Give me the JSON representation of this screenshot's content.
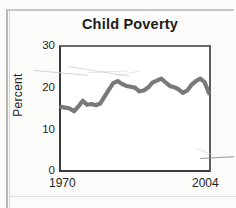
{
  "figure": {
    "background_color": "#fbfbf9",
    "line_color": "#6e6e6e",
    "axis_color": "#3a3a3a"
  },
  "chart_data": {
    "type": "line",
    "title": "Child Poverty",
    "xlabel": "",
    "ylabel": "Percent",
    "xlim": [
      1970,
      2004
    ],
    "ylim": [
      0,
      30
    ],
    "yticks": [
      0,
      10,
      20,
      30
    ],
    "xticks": [
      1970,
      2004
    ],
    "xtick_labels": [
      "1970",
      "2004"
    ],
    "ytick_labels": [
      "0",
      "10",
      "20",
      "30"
    ],
    "grid": false,
    "legend": null,
    "x": [
      1970,
      1971,
      1972,
      1973,
      1974,
      1975,
      1976,
      1977,
      1978,
      1979,
      1980,
      1981,
      1982,
      1983,
      1984,
      1985,
      1986,
      1987,
      1988,
      1989,
      1990,
      1991,
      1992,
      1993,
      1994,
      1995,
      1996,
      1997,
      1998,
      1999,
      2000,
      2001,
      2002,
      2003,
      2004
    ],
    "values": [
      15.4,
      15.2,
      15.0,
      14.3,
      15.5,
      16.9,
      15.9,
      16.1,
      15.8,
      16.2,
      17.9,
      19.6,
      21.2,
      21.7,
      21.0,
      20.5,
      20.3,
      20.1,
      19.2,
      19.4,
      20.1,
      21.3,
      21.8,
      22.3,
      21.4,
      20.5,
      20.2,
      19.7,
      18.8,
      19.4,
      20.8,
      21.7,
      22.3,
      21.4,
      18.7
    ],
    "series_name": "Child poverty rate"
  },
  "annotations": {
    "title_text": "Child Poverty",
    "y_axis_title": "Percent",
    "x_start_label": "1970",
    "x_end_label": "2004"
  }
}
